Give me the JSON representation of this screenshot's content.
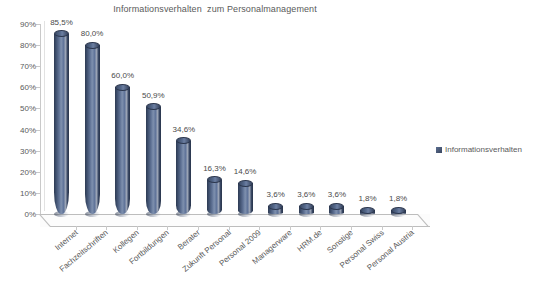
{
  "chart_data": {
    "type": "bar",
    "title": "Informationsverhalten  zum Personalmanagement",
    "xlabel": "",
    "ylabel": "",
    "ylim": [
      0,
      90
    ],
    "ytick_step": 10,
    "ytick_labels": [
      "0%",
      "10%",
      "20%",
      "30%",
      "40%",
      "50%",
      "60%",
      "70%",
      "80%",
      "90%"
    ],
    "grid": false,
    "legend_position": "right",
    "categories": [
      "Internet",
      "Fachzeitschriften",
      "Kollegen",
      "Fortbildungen",
      "Berater",
      "Zukunft Personal",
      "Personal 2009",
      "Managerware",
      "HRM.de",
      "Sonstige",
      "Personal Swiss",
      "Personal Austria"
    ],
    "values": [
      85.5,
      80.0,
      60.0,
      50.9,
      34.6,
      16.3,
      14.6,
      3.6,
      3.6,
      3.6,
      1.8,
      1.8
    ],
    "value_labels": [
      "85,5%",
      "80,0%",
      "60,0%",
      "50,9%",
      "34,6%",
      "16,3%",
      "14,6%",
      "3,6%",
      "3,6%",
      "3,6%",
      "1,8%",
      "1,8%"
    ],
    "series": [
      {
        "name": "Informationsverhalten",
        "color": "#4a5d80",
        "values": [
          85.5,
          80.0,
          60.0,
          50.9,
          34.6,
          16.3,
          14.6,
          3.6,
          3.6,
          3.6,
          1.8,
          1.8
        ]
      }
    ]
  },
  "legend": {
    "entries": [
      {
        "label": "Informationsverhalten",
        "color": "#4a5d80"
      }
    ]
  }
}
